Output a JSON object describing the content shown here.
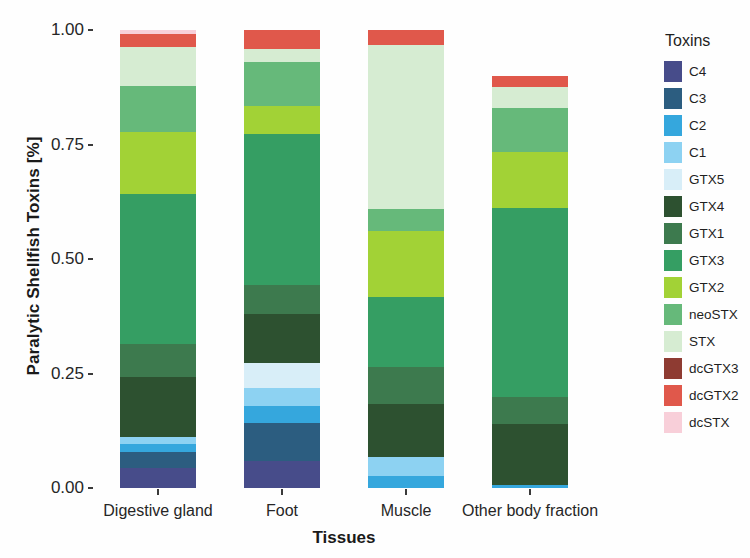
{
  "chart_data": {
    "type": "bar",
    "subtype": "stacked-100-percent",
    "title": "",
    "xlabel": "Tissues",
    "ylabel": "Paralytic Shellfish Toxins [%]",
    "legend_title": "Toxins",
    "legend_position": "right",
    "grid": false,
    "ylim": [
      0.0,
      1.0
    ],
    "ytick_labels": [
      "0.00",
      "0.25",
      "0.50",
      "0.75",
      "1.00"
    ],
    "ytick_values": [
      0.0,
      0.25,
      0.5,
      0.75,
      1.0
    ],
    "categories": [
      "Digestive gland",
      "Foot",
      "Muscle",
      "Other body fraction"
    ],
    "series": [
      {
        "name": "C4",
        "color": "#474c8a",
        "values": [
          0.043,
          0.059,
          0.0,
          0.0
        ]
      },
      {
        "name": "C3",
        "color": "#2c5d80",
        "values": [
          0.036,
          0.083,
          0.0,
          0.0
        ]
      },
      {
        "name": "C2",
        "color": "#35a7dd",
        "values": [
          0.017,
          0.037,
          0.026,
          0.006
        ]
      },
      {
        "name": "C1",
        "color": "#8dd2f2",
        "values": [
          0.016,
          0.039,
          0.041,
          0.0
        ]
      },
      {
        "name": "GTX5",
        "color": "#d8eef8",
        "values": [
          0.0,
          0.055,
          0.0,
          0.0
        ]
      },
      {
        "name": "GTX4",
        "color": "#2d5130",
        "values": [
          0.13,
          0.107,
          0.116,
          0.133
        ]
      },
      {
        "name": "GTX1",
        "color": "#3d7a4e",
        "values": [
          0.072,
          0.063,
          0.081,
          0.059
        ]
      },
      {
        "name": "GTX3",
        "color": "#359e63",
        "values": [
          0.328,
          0.33,
          0.153,
          0.413
        ]
      },
      {
        "name": "GTX2",
        "color": "#a2d236",
        "values": [
          0.135,
          0.061,
          0.144,
          0.122
        ]
      },
      {
        "name": "neoSTX",
        "color": "#66b97a",
        "values": [
          0.1,
          0.097,
          0.048,
          0.096
        ]
      },
      {
        "name": "STX",
        "color": "#d6ecd2",
        "values": [
          0.085,
          0.028,
          0.358,
          0.046
        ]
      },
      {
        "name": "dcGTX3",
        "color": "#8e3b32",
        "values": [
          0.0,
          0.0,
          0.0,
          0.0
        ]
      },
      {
        "name": "dcGTX2",
        "color": "#e0584b",
        "values": [
          0.03,
          0.041,
          0.033,
          0.025
        ]
      },
      {
        "name": "dcSTX",
        "color": "#f8cfd9",
        "values": [
          0.008,
          0.0,
          0.0,
          0.0
        ]
      }
    ]
  },
  "axis": {
    "y_title": "Paralytic Shellfish Toxins [%]",
    "x_title": "Tissues"
  },
  "legend": {
    "title": "Toxins"
  }
}
